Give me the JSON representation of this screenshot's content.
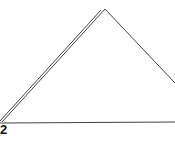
{
  "diagram": {
    "shape": "triangle",
    "stroke_color": "#444444",
    "vertex_label": "2"
  }
}
